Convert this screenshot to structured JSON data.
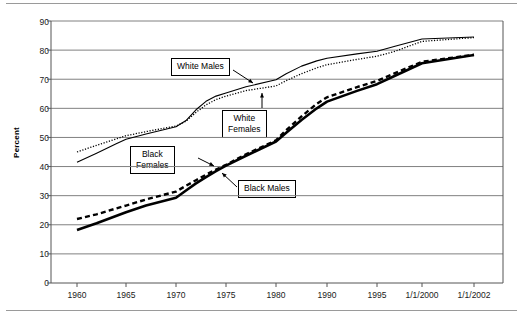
{
  "chart_data": {
    "type": "line",
    "title": "",
    "xlabel": "",
    "ylabel": "Percent",
    "ylim": [
      0,
      90
    ],
    "ytick_values": [
      0,
      10,
      20,
      30,
      40,
      50,
      60,
      70,
      80,
      90
    ],
    "ytick_labels": [
      "0",
      "10",
      "20",
      "30",
      "40",
      "50",
      "60",
      "70",
      "80",
      "90"
    ],
    "categories": [
      "1960",
      "1965",
      "1970",
      "1975",
      "1980",
      "1990",
      "1995",
      "1/1/2000",
      "1/1/2002"
    ],
    "x_values": [
      1960,
      1965,
      1970,
      1975,
      1980,
      1990,
      1995,
      2000,
      2002
    ],
    "grid": "horizontal",
    "legend_position": "callout-labels",
    "series": [
      {
        "name": "White Males",
        "style": "thin-solid",
        "color": "#000000",
        "x": [
          1960,
          1962,
          1964,
          1965,
          1967,
          1970,
          1971,
          1972,
          1973,
          1974,
          1975,
          1977,
          1980,
          1982,
          1985,
          1988,
          1990,
          1993,
          1995,
          1997,
          2000,
          2002
        ],
        "values": [
          41.5,
          44.6,
          47.8,
          49.4,
          51.2,
          53.7,
          55.8,
          59.5,
          62.4,
          64.2,
          65.3,
          67.4,
          69.8,
          71.9,
          74.5,
          76.3,
          77.2,
          78.7,
          79.6,
          81.3,
          83.8,
          84.5
        ]
      },
      {
        "name": "White Females",
        "style": "dotted",
        "color": "#000000",
        "x": [
          1960,
          1962,
          1964,
          1965,
          1967,
          1970,
          1971,
          1972,
          1973,
          1974,
          1975,
          1977,
          1980,
          1982,
          1985,
          1988,
          1990,
          1993,
          1995,
          1997,
          2000,
          2002
        ],
        "values": [
          45.0,
          47.3,
          49.5,
          50.6,
          52.0,
          53.9,
          55.6,
          58.6,
          61.2,
          63.0,
          64.2,
          66.1,
          67.7,
          69.5,
          71.9,
          73.9,
          75.0,
          76.8,
          77.9,
          79.6,
          83.0,
          84.3
        ]
      },
      {
        "name": "Black Males",
        "style": "thick-solid",
        "color": "#000000",
        "x": [
          1960,
          1962,
          1965,
          1967,
          1970,
          1971,
          1972,
          1973,
          1974,
          1975,
          1977,
          1980,
          1982,
          1985,
          1988,
          1990,
          1993,
          1995,
          1997,
          2000,
          2002
        ],
        "values": [
          18.2,
          20.5,
          24.3,
          26.6,
          29.3,
          31.8,
          34.2,
          36.4,
          38.4,
          40.3,
          43.7,
          48.6,
          51.6,
          56.0,
          60.0,
          62.3,
          66.0,
          68.3,
          71.2,
          75.5,
          78.3
        ]
      },
      {
        "name": "Black Females",
        "style": "dashed",
        "color": "#000000",
        "x": [
          1960,
          1962,
          1965,
          1967,
          1970,
          1971,
          1972,
          1973,
          1974,
          1975,
          1977,
          1980,
          1982,
          1985,
          1988,
          1990,
          1993,
          1995,
          1997,
          2000,
          2002
        ],
        "values": [
          22.0,
          23.6,
          26.6,
          28.7,
          31.4,
          33.4,
          35.3,
          37.2,
          39.0,
          40.6,
          44.2,
          49.0,
          52.5,
          57.2,
          61.6,
          63.8,
          67.3,
          69.4,
          72.1,
          76.0,
          78.4
        ]
      }
    ],
    "annotations": [
      {
        "label": "White Males",
        "target_series": "White Males"
      },
      {
        "label": "White\nFemales",
        "target_series": "White Females"
      },
      {
        "label": "Black\nFemales",
        "target_series": "Black Females"
      },
      {
        "label": "Black Males",
        "target_series": "Black Males"
      }
    ]
  },
  "axis": {
    "ylabel": "Percent",
    "yticks": [
      "90",
      "80",
      "70",
      "60",
      "50",
      "40",
      "30",
      "20",
      "10",
      "0"
    ],
    "xticks": [
      "1960",
      "1965",
      "1970",
      "1975",
      "1980",
      "1990",
      "1995",
      "1/1/2000",
      "1/1/2002"
    ]
  },
  "callouts": {
    "white_males": "White Males",
    "white_females": "White\nFemales",
    "black_females": "Black\nFemales",
    "black_males": "Black Males"
  }
}
